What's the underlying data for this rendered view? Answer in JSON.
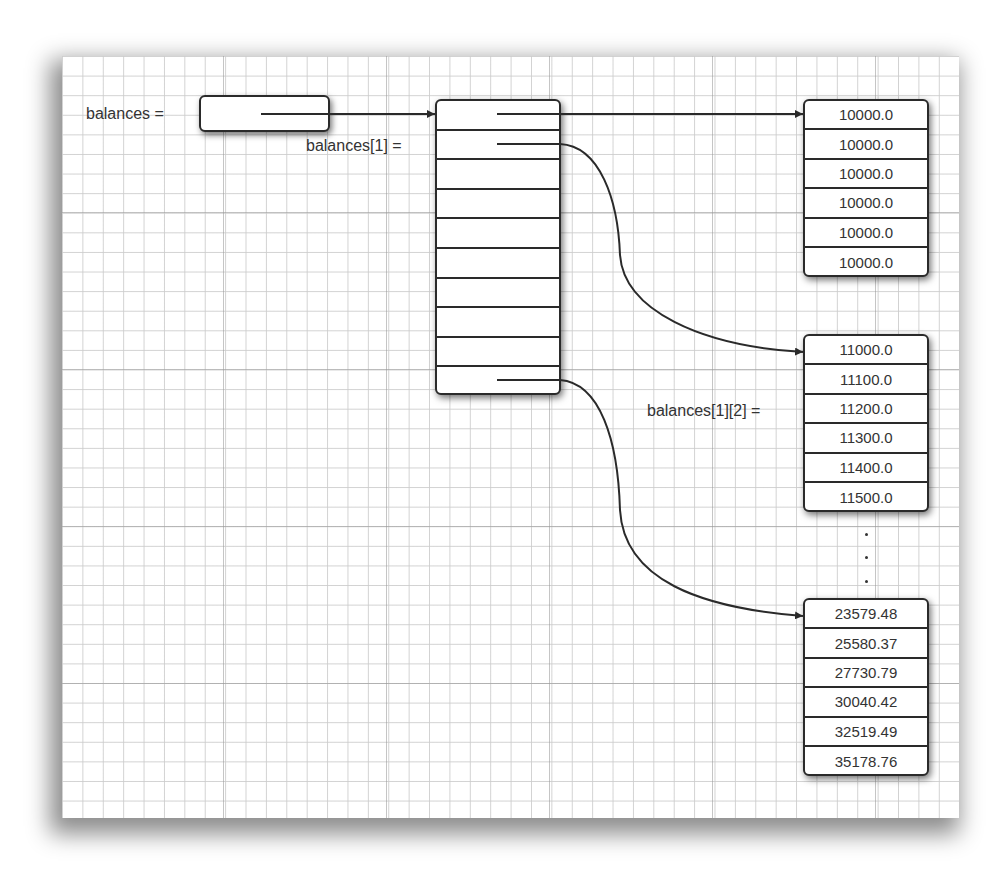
{
  "labels": {
    "balances": "balances =",
    "balances_1": "balances[1] =",
    "balances_1_2": "balances[1][2] ="
  },
  "outer_array": {
    "row_count": 10,
    "pointer_rows": [
      0,
      1,
      9
    ]
  },
  "inner_arrays": [
    {
      "name": "balances[0]",
      "values": [
        "10000.0",
        "10000.0",
        "10000.0",
        "10000.0",
        "10000.0",
        "10000.0"
      ]
    },
    {
      "name": "balances[1]",
      "values": [
        "11000.0",
        "11100.0",
        "11200.0",
        "11300.0",
        "11400.0",
        "11500.0"
      ]
    },
    {
      "name": "balances[9]",
      "values": [
        "23579.48",
        "25580.37",
        "27730.79",
        "30040.42",
        "32519.49",
        "35178.76"
      ]
    }
  ],
  "ellipsis": ".",
  "colors": {
    "line": "#2a2a2a",
    "text": "#333333",
    "grid_minor": "#cdcdcd",
    "grid_major": "#969696"
  }
}
